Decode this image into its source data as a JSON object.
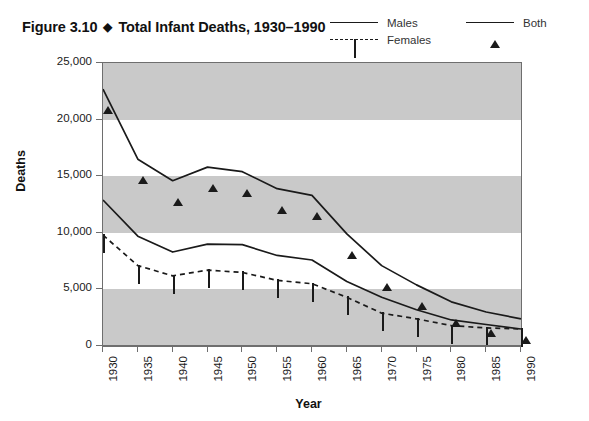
{
  "figure": {
    "number": "Figure 3.10",
    "separator": "◆",
    "title": "Total Infant Deaths, 1930–1990"
  },
  "legend": {
    "position": "top-right",
    "entries": [
      {
        "label": "Males",
        "marker": "filled-circle",
        "line": "solid"
      },
      {
        "label": "Females",
        "marker": "open-square",
        "line": "dashed"
      },
      {
        "label": "Both",
        "marker": "filled-triangle",
        "line": "solid"
      }
    ]
  },
  "axes": {
    "y_title": "Deaths",
    "x_title": "Year",
    "y_ticks": [
      "0",
      "5,000",
      "10,000",
      "15,000",
      "20,000",
      "25,000"
    ],
    "x_ticks": [
      "1930",
      "1935",
      "1940",
      "1945",
      "1950",
      "1955",
      "1960",
      "1965",
      "1970",
      "1975",
      "1980",
      "1985",
      "1990"
    ]
  },
  "colors": {
    "band": "#c9c9c9",
    "frame": "#6e6e6e",
    "ink": "#1a1a1a",
    "background": "#ffffff"
  },
  "chart_data": {
    "type": "line",
    "title": "Total Infant Deaths, 1930–1990",
    "xlabel": "Year",
    "ylabel": "Deaths",
    "xlim": [
      1930,
      1990
    ],
    "ylim": [
      0,
      25000
    ],
    "ytick_interval": 5000,
    "grid": "alternating horizontal gray bands every 5,000",
    "legend_position": "top-right",
    "x": [
      1930,
      1935,
      1940,
      1945,
      1950,
      1955,
      1960,
      1965,
      1970,
      1975,
      1980,
      1985,
      1990
    ],
    "series": [
      {
        "name": "Both",
        "marker": "filled-triangle",
        "line": "solid",
        "values": [
          22700,
          16500,
          14600,
          15800,
          15400,
          13900,
          13300,
          9900,
          7100,
          5400,
          3900,
          3000,
          2400
        ]
      },
      {
        "name": "Males",
        "marker": "filled-circle",
        "line": "solid",
        "values": [
          12900,
          9700,
          8300,
          9000,
          8950,
          8000,
          7600,
          5700,
          4300,
          3200,
          2300,
          1900,
          1500
        ]
      },
      {
        "name": "Females",
        "marker": "open-square",
        "line": "dashed",
        "values": [
          9800,
          7100,
          6200,
          6700,
          6500,
          5800,
          5500,
          4300,
          2900,
          2400,
          1800,
          1600,
          1500
        ]
      }
    ]
  }
}
